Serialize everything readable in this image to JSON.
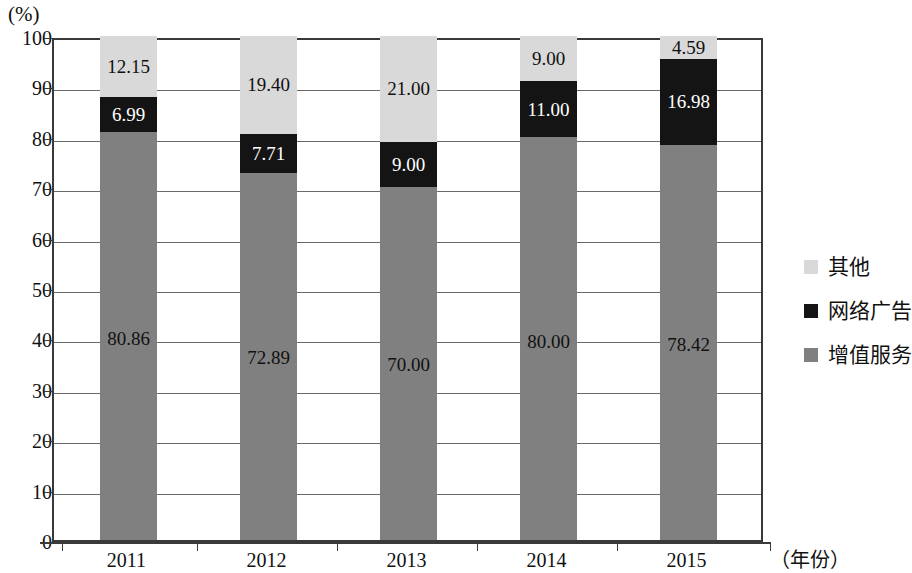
{
  "chart_data": {
    "type": "bar",
    "subtype": "stacked-percent",
    "title": "",
    "xlabel": "（年份）",
    "ylabel": "(%)",
    "ylim": [
      0,
      100
    ],
    "yticks": [
      0,
      10,
      20,
      30,
      40,
      50,
      60,
      70,
      80,
      90,
      100
    ],
    "ytick_labels": [
      "0",
      "10",
      "20",
      "30",
      "40",
      "50",
      "60",
      "70",
      "80",
      "90",
      "100"
    ],
    "categories": [
      "2011",
      "2012",
      "2013",
      "2014",
      "2015"
    ],
    "grid": true,
    "legend_position": "right",
    "series": [
      {
        "name": "其他",
        "key": "other",
        "color": "#d9d9d9",
        "label_color": "#111111",
        "values": [
          12.15,
          19.4,
          21.0,
          9.0,
          4.59
        ],
        "value_labels": [
          "12.15",
          "19.40",
          "21.00",
          "9.00",
          "4.59"
        ]
      },
      {
        "name": "网络广告",
        "key": "ads",
        "color": "#141414",
        "label_color": "#ffffff",
        "values": [
          6.99,
          7.71,
          9.0,
          11.0,
          16.98
        ],
        "value_labels": [
          "6.99",
          "7.71",
          "9.00",
          "11.00",
          "16.98"
        ]
      },
      {
        "name": "增值服务",
        "key": "vas",
        "color": "#808080",
        "label_color": "#111111",
        "values": [
          80.86,
          72.89,
          70.0,
          80.0,
          78.42
        ],
        "value_labels": [
          "80.86",
          "72.89",
          "70.00",
          "80.00",
          "78.42"
        ]
      }
    ]
  },
  "axis": {
    "unit_label": "(%)",
    "x_title": "（年份）",
    "ytick_labels": [
      "100",
      "90",
      "80",
      "70",
      "60",
      "50",
      "40",
      "30",
      "20",
      "10",
      "0"
    ],
    "xtick_labels": [
      "2011",
      "2012",
      "2013",
      "2014",
      "2015"
    ]
  },
  "legend": {
    "items": [
      {
        "label": "其他",
        "color": "#d9d9d9"
      },
      {
        "label": "网络广告",
        "color": "#141414"
      },
      {
        "label": "增值服务",
        "color": "#808080"
      }
    ]
  },
  "bars": [
    {
      "year": "2011",
      "other_label": "12.15",
      "ads_label": "6.99",
      "vas_label": "80.86"
    },
    {
      "year": "2012",
      "other_label": "19.40",
      "ads_label": "7.71",
      "vas_label": "72.89"
    },
    {
      "year": "2013",
      "other_label": "21.00",
      "ads_label": "9.00",
      "vas_label": "70.00"
    },
    {
      "year": "2014",
      "other_label": "9.00",
      "ads_label": "11.00",
      "vas_label": "80.00"
    },
    {
      "year": "2015",
      "other_label": "4.59",
      "ads_label": "16.98",
      "vas_label": "78.42"
    }
  ]
}
